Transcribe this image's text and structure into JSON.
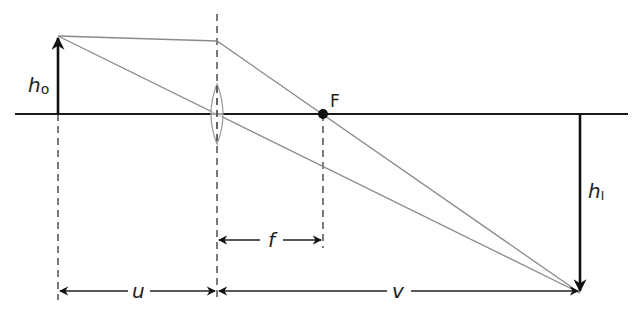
{
  "diagram": {
    "type": "thin converging lens ray diagram",
    "labels": {
      "object_height": "h",
      "object_height_sub": "o",
      "image_height": "h",
      "image_height_sub": "I",
      "focal_point": "F",
      "focal_length": "f",
      "object_distance": "u",
      "image_distance": "v"
    },
    "colors": {
      "axis": "#1a1a1a",
      "arrows": "#111111",
      "rays": "#8a8a8a",
      "dashed": "#222222",
      "lens": "#999999",
      "text": "#222222"
    },
    "geometry": {
      "axis_y": 114,
      "axis_x_start": 15,
      "axis_x_end": 628,
      "object_x": 58,
      "object_top_y": 36,
      "lens_x": 217,
      "lens_ray_y": 41,
      "focal_x": 323,
      "image_x": 580,
      "image_bottom_y": 293,
      "f_arrow_y": 240,
      "uv_arrow_y": 291
    }
  }
}
